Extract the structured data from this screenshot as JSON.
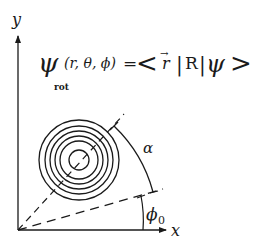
{
  "diagram": {
    "type": "rotated wavefunction schematic",
    "axes": {
      "x_label": "x",
      "y_label": "y",
      "origin": [
        18,
        230
      ],
      "x_end": [
        166,
        230
      ],
      "y_end": [
        18,
        36
      ]
    },
    "formula": {
      "lhs_symbol": "ψ",
      "lhs_subscript": "rot",
      "lhs_args": "(r, θ, ϕ)",
      "equals": "=",
      "rhs_open": "<",
      "rhs_vector": "r",
      "rhs_vector_arrow": "→",
      "rhs_bar1": "|",
      "rhs_operator": "R",
      "rhs_bar2": "|",
      "rhs_ket": "ψ",
      "rhs_close": ">"
    },
    "contours": {
      "center": [
        79,
        160
      ],
      "radii": [
        40,
        34,
        29,
        24,
        19,
        10
      ],
      "description": "concentric circles (wavefunction contours)"
    },
    "lines": {
      "rotated_axis": "dashed line from origin through contour center",
      "reference_axis": "dashed line from origin at angle phi0 above x axis"
    },
    "angles": {
      "alpha_label": "α",
      "phi0_label": "ϕ",
      "phi0_subscript": "0"
    },
    "colors": {
      "ink": "#1a1a1a",
      "background": "#ffffff"
    }
  }
}
